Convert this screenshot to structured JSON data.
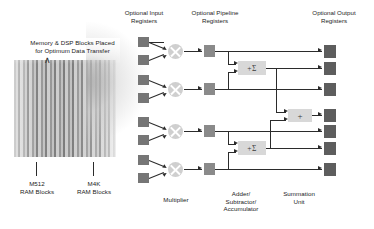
{
  "diagram": {
    "title": "Memory & DSP Blocks Placed for Optimum Data Transfer",
    "memory_caption": "Memory & DSP Blocks Placed\nfor Optimum Data Transfer",
    "caret_glyph": "∧",
    "memory_labels": {
      "m512": "M512\nRAM Blocks",
      "m4k": "M4K\nRAM Blocks"
    },
    "column_headers": {
      "input_registers": "Optional Input\nRegisters",
      "pipeline_registers": "Optional Pipeline\nRegisters",
      "output_registers": "Optional Output\nRegisters"
    },
    "bottom_labels": {
      "multiplier": "Multiplier",
      "adder": "Adder/\nSubtractor/\nAccumulator",
      "summation": "Summation\nUnit"
    },
    "operators": {
      "sigma": "+Σ",
      "plus": "+"
    },
    "counts": {
      "input_registers": 8,
      "multipliers": 4,
      "pipeline_registers": 4,
      "adders": 2,
      "summation_units": 1,
      "output_registers": 7
    },
    "colors": {
      "register_input": "#767676",
      "register_pipeline": "#8a8a8a",
      "register_output": "#5d5d5d",
      "multiplier": "#cfcfcf",
      "operator_block": "#d8d8d8",
      "wire": "#2b2b2b",
      "background": "#ffffff",
      "text": "#1d1d1d"
    }
  }
}
